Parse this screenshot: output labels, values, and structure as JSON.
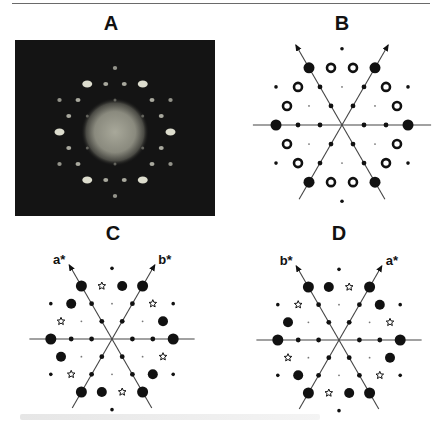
{
  "figure": {
    "panels": [
      {
        "id": "A",
        "label": "A",
        "label_x": 111,
        "label_y": 12,
        "kind": "photo"
      },
      {
        "id": "B",
        "label": "B",
        "label_x": 342,
        "label_y": 12,
        "kind": "schematic",
        "center": [
          342,
          125
        ],
        "spacing": 22,
        "axis_labels": null
      },
      {
        "id": "C",
        "label": "C",
        "label_x": 113,
        "label_y": 222,
        "kind": "schematic",
        "center": [
          112,
          339
        ],
        "spacing": 20.4,
        "axis_labels": {
          "left": "a*",
          "right": "b*"
        }
      },
      {
        "id": "D",
        "label": "D",
        "label_x": 339,
        "label_y": 222,
        "kind": "schematic",
        "center": [
          339,
          340
        ],
        "spacing": 20.4,
        "axis_labels": {
          "left": "b*",
          "right": "a*"
        }
      }
    ],
    "legend_symbols": {
      "large_dot": "filled-circle",
      "ring": "open-ring",
      "star": "open-star",
      "asterisk": "small-asterisk",
      "axis_dot": "small-filled-dot",
      "faint_dot": "tiny-dot"
    },
    "colors": {
      "ink": "#111111",
      "line": "#444444",
      "photo_bg": "#141414",
      "spot": "#e8e8d8"
    }
  },
  "lattice": {
    "vertices": [
      [
        3,
        0
      ],
      [
        0,
        3
      ],
      [
        -3,
        3
      ],
      [
        -3,
        0
      ],
      [
        0,
        -3
      ],
      [
        3,
        -3
      ]
    ],
    "sqrt3_points": [
      [
        2,
        2
      ],
      [
        -2,
        4
      ],
      [
        -4,
        2
      ],
      [
        -2,
        -2
      ],
      [
        2,
        -4
      ],
      [
        4,
        -2
      ]
    ],
    "faint_points": [
      [
        1,
        1
      ],
      [
        -1,
        2
      ],
      [
        -2,
        1
      ],
      [
        -1,
        -1
      ],
      [
        1,
        -2
      ],
      [
        2,
        -1
      ]
    ],
    "axis_points": [
      [
        1,
        0
      ],
      [
        2,
        0
      ],
      [
        -1,
        0
      ],
      [
        -2,
        0
      ],
      [
        0,
        1
      ],
      [
        0,
        2
      ],
      [
        0,
        -1
      ],
      [
        0,
        -2
      ],
      [
        -1,
        1
      ],
      [
        -2,
        2
      ],
      [
        1,
        -1
      ],
      [
        2,
        -2
      ]
    ],
    "edge_points": [
      [
        -1,
        3
      ],
      [
        -2,
        3
      ],
      [
        1,
        2
      ],
      [
        2,
        1
      ],
      [
        3,
        -1
      ],
      [
        3,
        -2
      ],
      [
        1,
        -3
      ],
      [
        2,
        -3
      ],
      [
        -1,
        -2
      ],
      [
        -2,
        -1
      ],
      [
        -3,
        1
      ],
      [
        -3,
        2
      ]
    ]
  },
  "panel_B_edges": {
    "symbols": [
      "ring",
      "ring",
      "ring",
      "ring",
      "ring",
      "ring",
      "ring",
      "ring",
      "ring",
      "ring",
      "ring",
      "ring"
    ]
  },
  "panel_C_edges": {
    "symbols": [
      "large_dot",
      "star",
      "star",
      "large_dot",
      "star",
      "large_dot",
      "large_dot",
      "star",
      "star",
      "large_dot",
      "star",
      "large_dot"
    ]
  },
  "panel_D_edges": {
    "symbols": [
      "star",
      "large_dot",
      "large_dot",
      "star",
      "large_dot",
      "star",
      "star",
      "large_dot",
      "large_dot",
      "star",
      "large_dot",
      "star"
    ]
  }
}
